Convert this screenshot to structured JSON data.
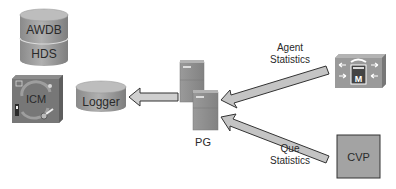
{
  "diagram": {
    "nodes": {
      "awdb_hds": {
        "top_label": "AWDB",
        "bottom_label": "HDS",
        "shape": "stacked-cylinder"
      },
      "icm": {
        "label": "ICM",
        "shape": "router-box"
      },
      "logger": {
        "label": "Logger",
        "shape": "cylinder"
      },
      "pg": {
        "label": "PG",
        "shape": "server-pair"
      },
      "unified_cm": {
        "label": "",
        "icon": "call-manager-icon",
        "glyph": "M"
      },
      "cvp": {
        "label": "CVP",
        "shape": "box"
      }
    },
    "edges": [
      {
        "from": "pg",
        "to": "logger",
        "label": ""
      },
      {
        "from": "unified_cm",
        "to": "pg",
        "label_line1": "Agent",
        "label_line2": "Statistics"
      },
      {
        "from": "cvp",
        "to": "pg",
        "label_line1": "Que",
        "label_line2": "Statistics"
      }
    ]
  },
  "colors": {
    "background": "#ffffff",
    "device_fill": "#9c9c9c",
    "device_top": "#b8b8b8",
    "device_dark": "#6f6f6f",
    "arrow_fill": "#c4c4c4",
    "arrow_stroke": "#333333",
    "text": "#2a2a2a"
  }
}
